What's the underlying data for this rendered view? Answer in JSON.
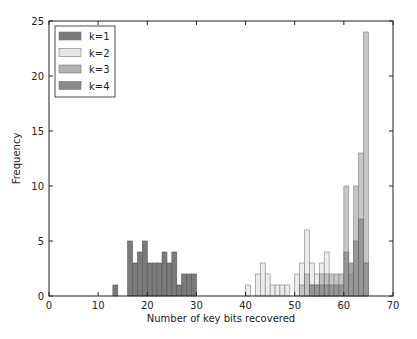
{
  "chart_data": {
    "type": "bar",
    "title": "",
    "xlabel": "Number of key bits recovered",
    "ylabel": "Frequency",
    "xlim": [
      0,
      70
    ],
    "ylim": [
      0,
      25
    ],
    "xticks": [
      0,
      10,
      20,
      30,
      40,
      50,
      60,
      70
    ],
    "yticks": [
      0,
      5,
      10,
      15,
      20,
      25
    ],
    "grid": false,
    "legend_position": "upper left",
    "series": [
      {
        "name": "k=1",
        "color": "#7a7a7a",
        "x": [
          13,
          16,
          17,
          18,
          19,
          20,
          21,
          22,
          23,
          24,
          25,
          26,
          27,
          28,
          29
        ],
        "values": [
          1,
          5,
          3,
          4,
          5,
          3,
          3,
          3,
          4,
          3,
          4,
          1,
          2,
          2,
          2
        ]
      },
      {
        "name": "k=2",
        "color": "#e6e6e6",
        "x": [
          40,
          42,
          43,
          44,
          45,
          46,
          47,
          48,
          50,
          51,
          52,
          53,
          54,
          55,
          56
        ],
        "values": [
          1,
          2,
          3,
          2,
          1,
          1,
          1,
          1,
          2,
          3,
          6,
          3,
          2,
          3,
          4
        ]
      },
      {
        "name": "k=3",
        "color": "#b4b4b4",
        "x": [
          51,
          52,
          53,
          54,
          55,
          56,
          57,
          58,
          59,
          60,
          61,
          62,
          63,
          64
        ],
        "values": [
          1,
          2,
          1,
          1,
          2,
          2,
          2,
          2,
          2,
          10,
          2,
          10,
          13,
          24
        ]
      },
      {
        "name": "k=4",
        "color": "#888888",
        "x": [
          53,
          54,
          55,
          56,
          57,
          58,
          59,
          60,
          61,
          62,
          63,
          64
        ],
        "values": [
          1,
          1,
          1,
          1,
          1,
          1,
          1,
          4,
          3,
          5,
          7,
          3
        ]
      }
    ]
  },
  "legend": {
    "items": [
      "k=1",
      "k=2",
      "k=3",
      "k=4"
    ]
  },
  "axes": {
    "xlabel": "Number of key bits recovered",
    "ylabel": "Frequency"
  }
}
